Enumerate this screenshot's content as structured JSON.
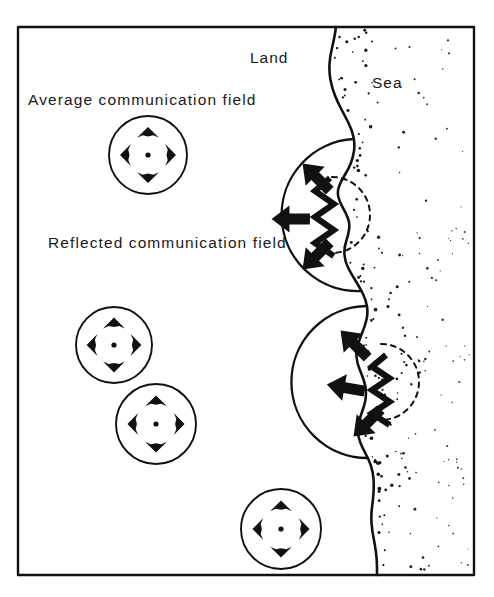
{
  "figure": {
    "name": "communication-field-coastline-diagram",
    "background_color": "#ffffff",
    "ink_color": "#111111",
    "frame": {
      "x": 18,
      "y": 27,
      "width": 456,
      "height": 548,
      "stroke_width": 2.4
    }
  },
  "labels": {
    "land": "Land",
    "sea": "Sea",
    "average_field": "Average communication field",
    "reflected_field": "Reflected communication field"
  },
  "label_positions": {
    "land": {
      "x": 250,
      "y": 63
    },
    "sea": {
      "x": 372,
      "y": 88
    },
    "average_field": {
      "x": 28,
      "y": 105
    },
    "reflected_field": {
      "x": 48,
      "y": 248
    }
  },
  "average_fields": [
    {
      "id": "average-field-1",
      "cx": 148,
      "cy": 155,
      "r": 39
    },
    {
      "id": "average-field-2",
      "cx": 114,
      "cy": 345,
      "r": 38
    },
    {
      "id": "average-field-3",
      "cx": 156,
      "cy": 424,
      "r": 40
    },
    {
      "id": "average-field-4",
      "cx": 281,
      "cy": 529,
      "r": 40
    }
  ],
  "average_field_arrows": {
    "directions": [
      "up",
      "down",
      "left",
      "right"
    ],
    "offset": 22,
    "center_dot_radius": 2.6
  },
  "reflected_fields": [
    {
      "id": "reflected-field-upper",
      "cx": 299,
      "cy": 215,
      "r": 76,
      "arrows": [
        {
          "direction": "up-left",
          "x": 317,
          "y": 178,
          "angle": 225
        },
        {
          "direction": "left",
          "x": 292,
          "y": 219,
          "angle": 180
        },
        {
          "direction": "down-left",
          "x": 317,
          "y": 255,
          "angle": 135
        }
      ],
      "dashed_arc": {
        "cx": 332,
        "cy": 215,
        "r": 38
      },
      "zigzag": {
        "x": 330,
        "y": 178,
        "height": 78,
        "amplitude": 15,
        "cycles": 3
      }
    },
    {
      "id": "reflected-field-lower",
      "cx": 354,
      "cy": 382,
      "r": 76,
      "arrows": [
        {
          "direction": "up-left",
          "x": 355,
          "y": 345,
          "angle": 225
        },
        {
          "direction": "left",
          "x": 347,
          "y": 388,
          "angle": 190
        },
        {
          "direction": "down-left",
          "x": 368,
          "y": 422,
          "angle": 135
        }
      ],
      "dashed_arc": {
        "cx": 381,
        "cy": 382,
        "r": 38
      },
      "zigzag": {
        "x": 386,
        "y": 355,
        "height": 70,
        "amplitude": 14,
        "cycles": 3
      }
    }
  ],
  "coastline": {
    "description": "meandering land-sea boundary from top frame to bottom frame",
    "points": [
      [
        336,
        27
      ],
      [
        334,
        40
      ],
      [
        330,
        56
      ],
      [
        329,
        72
      ],
      [
        332,
        88
      ],
      [
        338,
        103
      ],
      [
        345,
        116
      ],
      [
        352,
        130
      ],
      [
        355,
        144
      ],
      [
        353,
        158
      ],
      [
        348,
        170
      ],
      [
        341,
        181
      ],
      [
        337,
        192
      ],
      [
        340,
        203
      ],
      [
        346,
        213
      ],
      [
        350,
        224
      ],
      [
        348,
        236
      ],
      [
        344,
        248
      ],
      [
        345,
        262
      ],
      [
        352,
        275
      ],
      [
        360,
        288
      ],
      [
        366,
        300
      ],
      [
        368,
        313
      ],
      [
        365,
        326
      ],
      [
        360,
        338
      ],
      [
        356,
        350
      ],
      [
        357,
        363
      ],
      [
        362,
        375
      ],
      [
        366,
        387
      ],
      [
        366,
        400
      ],
      [
        362,
        412
      ],
      [
        358,
        424
      ],
      [
        358,
        437
      ],
      [
        363,
        449
      ],
      [
        369,
        460
      ],
      [
        373,
        472
      ],
      [
        374,
        486
      ],
      [
        373,
        500
      ],
      [
        371,
        515
      ],
      [
        372,
        530
      ],
      [
        375,
        545
      ],
      [
        377,
        560
      ],
      [
        377,
        575
      ]
    ]
  },
  "sea_stipple": {
    "description": "random dots filling the sea region, denser near the coast",
    "dot_radius_range": [
      0.8,
      1.9
    ],
    "dot_count": 210
  },
  "colors": {
    "ink": "#111111",
    "paper": "#ffffff",
    "text": "#1a1a1a"
  }
}
